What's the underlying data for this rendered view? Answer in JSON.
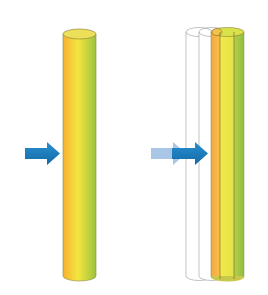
{
  "figure": {
    "width": 268,
    "height": 295,
    "background": "#ffffff",
    "left_panel": {
      "description": "single solid cylinder with incoming arrow",
      "cylinder": {
        "x": 63,
        "width": 33,
        "top": 34,
        "bottom": 280,
        "gradient": [
          "#f7b733",
          "#f3e640",
          "#a9c93f"
        ]
      },
      "arrow": {
        "x": 25,
        "y": 153,
        "length": 35,
        "color": "#1a7ab8"
      }
    },
    "right_panel": {
      "description": "cylinder shown at successive positions (ghost outlines) plus colored layered cylinder, with arrow showing motion",
      "ghost_cylinders": [
        {
          "x": 186,
          "width": 26
        },
        {
          "x": 199,
          "width": 26
        }
      ],
      "layers": [
        {
          "name": "orange",
          "x": 211,
          "width": 9,
          "color": "#f5b544"
        },
        {
          "name": "yellow",
          "x": 220,
          "width": 14,
          "color": "#eee94a"
        },
        {
          "name": "green",
          "x": 234,
          "width": 10,
          "color": "#a3c94a"
        }
      ],
      "top": 32,
      "bottom": 280,
      "arrow_trail_color": "#a9c6e6",
      "arrow_color": "#1a7ab8"
    }
  }
}
